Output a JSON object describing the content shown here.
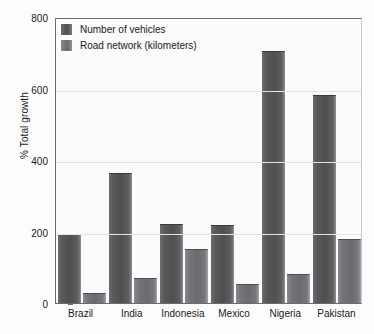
{
  "chart_data": {
    "type": "bar",
    "title": "",
    "xlabel": "",
    "ylabel": "% Total growth",
    "ylim": [
      0,
      800
    ],
    "yticks": [
      0,
      200,
      400,
      600,
      800
    ],
    "ytick_labels": [
      "0",
      "200",
      "400",
      "600",
      "800"
    ],
    "grid": true,
    "legend_position": "top-left",
    "categories": [
      "Brazil",
      "India",
      "Indonesia",
      "Mexico",
      "Nigeria",
      "Pakistan"
    ],
    "series": [
      {
        "name": "Number of vehicles",
        "color": "#4f4f52",
        "values": [
          192,
          365,
          222,
          217,
          705,
          583
        ]
      },
      {
        "name": "Road network (kilometers)",
        "color": "#6b6b6f",
        "values": [
          28,
          70,
          150,
          52,
          82,
          178
        ]
      }
    ]
  }
}
